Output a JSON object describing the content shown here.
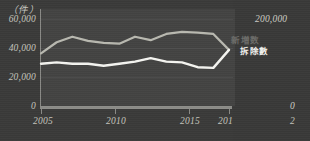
{
  "chart_data": {
    "type": "line",
    "title": "",
    "unit_label": "（件）",
    "xlabel": "",
    "ylabel": "",
    "grid": true,
    "legend_position": "right-inline",
    "xlim": [
      2005,
      2017
    ],
    "ylim": [
      0,
      70000
    ],
    "x": [
      2005,
      2006,
      2007,
      2008,
      2009,
      2010,
      2011,
      2012,
      2013,
      2014,
      2015,
      2016,
      2017
    ],
    "xtick_labels": [
      "2005",
      "2010",
      "2015",
      "2017"
    ],
    "xticks": [
      2005,
      2010,
      2015,
      2017
    ],
    "ytick_labels": [
      "0",
      "20,000",
      "40,000",
      "60,000"
    ],
    "yticks": [
      0,
      20000,
      40000,
      60000
    ],
    "series": [
      {
        "name": "新増数",
        "color": "#b9b9b0",
        "values": [
          38000,
          46000,
          50000,
          47000,
          45500,
          45000,
          50000,
          47500,
          52000,
          53500,
          53000,
          52000,
          40500
        ]
      },
      {
        "name": "拆除數",
        "color": "#f5f5f1",
        "values": [
          30500,
          31500,
          30500,
          30500,
          29000,
          30500,
          32000,
          34500,
          32000,
          31500,
          28000,
          27500,
          40500
        ]
      }
    ]
  },
  "right_panel": {
    "ytick_top": "200,000",
    "ytick_zero": "0",
    "xtick_partial": "2"
  }
}
